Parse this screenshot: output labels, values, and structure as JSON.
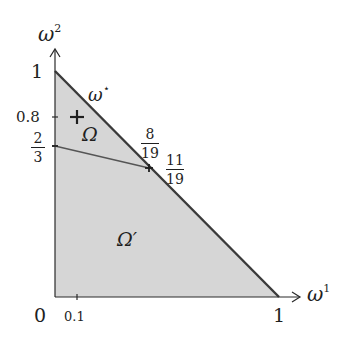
{
  "diagram": {
    "type": "region-plot",
    "axes": {
      "x": {
        "label": "ω",
        "label_sup": "1",
        "ticks": [
          "0",
          "0.1",
          "1"
        ]
      },
      "y": {
        "label": "ω",
        "label_sup": "2",
        "ticks": [
          "1",
          "0.8"
        ],
        "fraction_tick": {
          "num": "2",
          "den": "3"
        }
      }
    },
    "line_label": {
      "text": "ω",
      "sup": "⋆"
    },
    "regions": {
      "upper": {
        "label": "Ω"
      },
      "lower": {
        "label": "Ω′"
      }
    },
    "intersection": {
      "x_frac": {
        "num": "8",
        "den": "19"
      },
      "y_frac": {
        "num": "11",
        "den": "19"
      }
    },
    "marker": {
      "symbol": "+",
      "point": [
        0.1,
        0.8
      ]
    },
    "colors": {
      "fill": "#d6d6d6",
      "line": "#3a3a3a",
      "axis": "#2a2a2a"
    }
  }
}
